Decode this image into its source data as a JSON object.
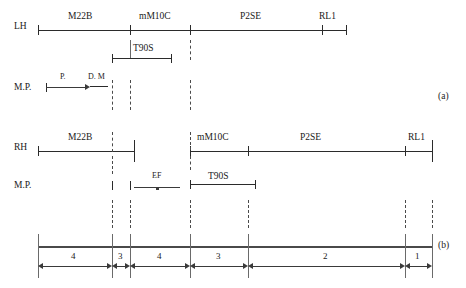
{
  "panels": [
    {
      "id": "a",
      "label": "(a)"
    },
    {
      "id": "b",
      "label": "(b)"
    }
  ],
  "rows": {
    "lh": {
      "label": "LH",
      "segments": [
        {
          "name": "M22B"
        },
        {
          "name": "mM10C"
        },
        {
          "name": "P2SE"
        },
        {
          "name": "RL1"
        }
      ]
    },
    "rh": {
      "label": "RH",
      "segments": [
        {
          "name": "M22B"
        },
        {
          "name": "mM10C"
        },
        {
          "name": "P2SE"
        },
        {
          "name": "RL1"
        }
      ]
    },
    "mp_top": {
      "label": "M.P.",
      "markers": [
        {
          "name": "P."
        },
        {
          "name": "D. M"
        }
      ],
      "span": {
        "name": "T90S"
      }
    },
    "mp_bottom": {
      "label": "M.P.",
      "markers": [
        {
          "name": "EF"
        }
      ],
      "span": {
        "name": "T90S"
      }
    }
  },
  "scale": {
    "intervals": [
      {
        "value": "4"
      },
      {
        "value": "3"
      },
      {
        "value": "4"
      },
      {
        "value": "3"
      },
      {
        "value": "2"
      },
      {
        "value": "1"
      }
    ]
  },
  "colors": {
    "line": "#2b2b2b",
    "bar": "#4a4a4a",
    "guide": "#6a6a6a",
    "text": "#1a1a1a"
  }
}
